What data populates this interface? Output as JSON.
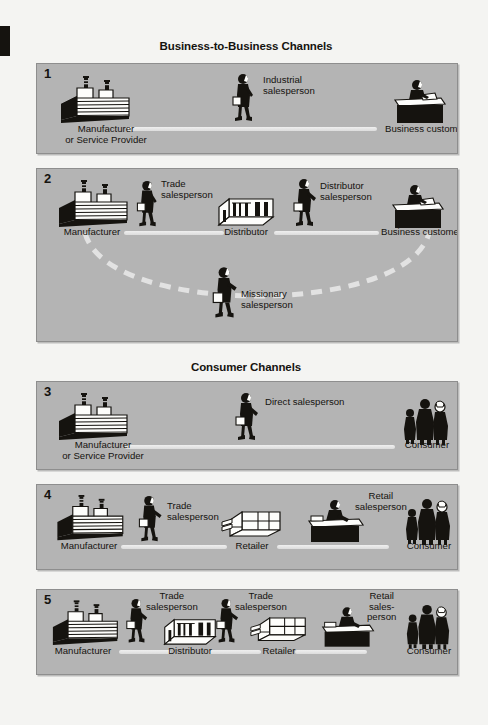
{
  "document": {
    "type": "marketing-channels-diagram",
    "background_color": "#f4f4f2",
    "panel_color": "#b4b4b4",
    "ink_color": "#15130f",
    "connector_color": "#e8e8e8"
  },
  "sections": [
    {
      "id": "b2b",
      "title": "Business-to-Business Channels"
    },
    {
      "id": "consumer",
      "title": "Consumer Channels"
    }
  ],
  "panels": [
    {
      "number": "1",
      "section": "b2b",
      "nodes": [
        {
          "name": "manufacturer",
          "icon": "factory-icon",
          "label": "Manufacturer\nor Service Provider"
        },
        {
          "name": "business-customer",
          "icon": "desk-person-icon",
          "label": "Business customer"
        }
      ],
      "roles": [
        {
          "name": "industrial-salesperson",
          "icon": "walking-salesperson-icon",
          "label": "Industrial\nsalesperson"
        }
      ]
    },
    {
      "number": "2",
      "section": "b2b",
      "nodes": [
        {
          "name": "manufacturer",
          "icon": "factory-icon",
          "label": "Manufacturer"
        },
        {
          "name": "distributor",
          "icon": "warehouse-icon",
          "label": "Distributor"
        },
        {
          "name": "business-customer",
          "icon": "desk-person-icon",
          "label": "Business customer"
        }
      ],
      "roles": [
        {
          "name": "trade-salesperson",
          "icon": "walking-salesperson-icon",
          "label": "Trade\nsalesperson"
        },
        {
          "name": "distributor-salesperson",
          "icon": "walking-salesperson-icon",
          "label": "Distributor\nsalesperson"
        },
        {
          "name": "missionary-salesperson",
          "icon": "walking-salesperson-icon",
          "label": "Missionary\nsalesperson"
        }
      ]
    },
    {
      "number": "3",
      "section": "consumer",
      "nodes": [
        {
          "name": "manufacturer",
          "icon": "factory-icon",
          "label": "Manufacturer\nor Service Provider"
        },
        {
          "name": "consumer",
          "icon": "consumer-group-icon",
          "label": "Consumer"
        }
      ],
      "roles": [
        {
          "name": "direct-salesperson",
          "icon": "walking-salesperson-icon",
          "label": "Direct salesperson"
        }
      ]
    },
    {
      "number": "4",
      "section": "consumer",
      "nodes": [
        {
          "name": "manufacturer",
          "icon": "factory-icon",
          "label": "Manufacturer"
        },
        {
          "name": "retailer",
          "icon": "store-icon",
          "label": "Retailer"
        },
        {
          "name": "consumer",
          "icon": "consumer-group-icon",
          "label": "Consumer"
        }
      ],
      "roles": [
        {
          "name": "trade-salesperson",
          "icon": "walking-salesperson-icon",
          "label": "Trade\nsalesperson"
        },
        {
          "name": "retail-salesperson",
          "icon": "counter-person-icon",
          "label": "Retail\nsalesperson"
        }
      ]
    },
    {
      "number": "5",
      "section": "consumer",
      "nodes": [
        {
          "name": "manufacturer",
          "icon": "factory-icon",
          "label": "Manufacturer"
        },
        {
          "name": "distributor",
          "icon": "warehouse-icon",
          "label": "Distributor"
        },
        {
          "name": "retailer",
          "icon": "store-icon",
          "label": "Retailer"
        },
        {
          "name": "consumer",
          "icon": "consumer-group-icon",
          "label": "Consumer"
        }
      ],
      "roles": [
        {
          "name": "trade-salesperson-1",
          "icon": "walking-salesperson-icon",
          "label": "Trade\nsalesperson"
        },
        {
          "name": "trade-salesperson-2",
          "icon": "walking-salesperson-icon",
          "label": "Trade\nsalesperson"
        },
        {
          "name": "retail-salesperson",
          "icon": "counter-person-icon",
          "label": "Retail\nsales-\nperson"
        }
      ]
    }
  ],
  "labels": {
    "p1_num": "1",
    "p1_manufacturer_l1": "Manufacturer",
    "p1_manufacturer_l2": "or Service Provider",
    "p1_customer": "Business customer",
    "p1_role_l1": "Industrial",
    "p1_role_l2": "salesperson",
    "p2_num": "2",
    "p2_manufacturer": "Manufacturer",
    "p2_distributor": "Distributor",
    "p2_customer": "Business customer",
    "p2_trade_l1": "Trade",
    "p2_trade_l2": "salesperson",
    "p2_dist_l1": "Distributor",
    "p2_dist_l2": "salesperson",
    "p2_miss_l1": "Missionary",
    "p2_miss_l2": "salesperson",
    "p3_num": "3",
    "p3_manufacturer_l1": "Manufacturer",
    "p3_manufacturer_l2": "or Service Provider",
    "p3_consumer": "Consumer",
    "p3_role": "Direct salesperson",
    "p4_num": "4",
    "p4_manufacturer": "Manufacturer",
    "p4_retailer": "Retailer",
    "p4_consumer": "Consumer",
    "p4_trade_l1": "Trade",
    "p4_trade_l2": "salesperson",
    "p4_retail_l1": "Retail",
    "p4_retail_l2": "salesperson",
    "p5_num": "5",
    "p5_manufacturer": "Manufacturer",
    "p5_distributor": "Distributor",
    "p5_retailer": "Retailer",
    "p5_consumer": "Consumer",
    "p5_trade1_l1": "Trade",
    "p5_trade1_l2": "salesperson",
    "p5_trade2_l1": "Trade",
    "p5_trade2_l2": "salesperson",
    "p5_retail_l1": "Retail",
    "p5_retail_l2": "sales-",
    "p5_retail_l3": "person"
  }
}
